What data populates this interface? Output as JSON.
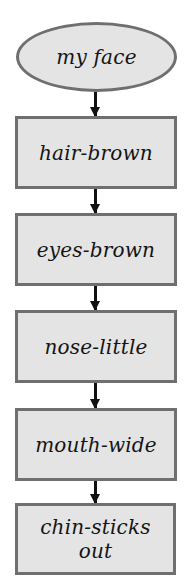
{
  "diagram": {
    "type": "flowchart",
    "direction": "top-to-bottom",
    "colors": {
      "node_fill": "#e4e4e4",
      "node_border": "#6f6f6f",
      "text": "#141414",
      "arrow": "#111111",
      "background": "#ffffff"
    },
    "start": {
      "shape": "ellipse",
      "label": "my face"
    },
    "nodes": [
      {
        "shape": "rectangle",
        "label": "hair-brown"
      },
      {
        "shape": "rectangle",
        "label": "eyes-brown"
      },
      {
        "shape": "rectangle",
        "label": "nose-little"
      },
      {
        "shape": "rectangle",
        "label": "mouth-wide"
      },
      {
        "shape": "rectangle",
        "label": "chin-sticks out"
      }
    ],
    "edges": [
      {
        "from": "my face",
        "to": "hair-brown"
      },
      {
        "from": "hair-brown",
        "to": "eyes-brown"
      },
      {
        "from": "eyes-brown",
        "to": "nose-little"
      },
      {
        "from": "nose-little",
        "to": "mouth-wide"
      },
      {
        "from": "mouth-wide",
        "to": "chin-sticks out"
      }
    ]
  }
}
